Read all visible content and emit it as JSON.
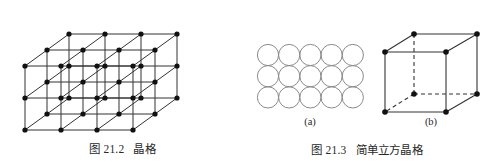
{
  "page": {
    "background": "#ffffff",
    "width": 489,
    "height": 168,
    "ink_color": "#333333",
    "node_color": "#111111",
    "sphere_stroke": "#8a8a8a"
  },
  "figures": [
    {
      "id": "lattice",
      "caption_number": "图 21.2",
      "caption_title": "晶格",
      "caption_full": "图 21.2　晶格",
      "diagram": {
        "type": "oblique-3d-point-lattice",
        "description": "three-dimensional crystal lattice drawn in oblique projection with filled nodes at every lattice point joined by straight edges",
        "grid_counts": {
          "columns": 4,
          "rows": 3,
          "layers": 3
        },
        "node_count": 36,
        "origin": {
          "x": 25,
          "y": 130
        },
        "vectors": {
          "a_right": {
            "dx": 36,
            "dy": 0
          },
          "b_depth": {
            "dx": 22,
            "dy": -16
          },
          "c_up": {
            "dx": 0,
            "dy": -32
          }
        },
        "node_radius": 2.6,
        "edge_width": 1.0
      }
    },
    {
      "id": "simple-cubic",
      "caption_number": "图 21.3",
      "caption_title": "简单立方晶格",
      "caption_full": "图 21.3　简单立方晶格",
      "panels": [
        {
          "label": "(a)",
          "diagram": {
            "type": "circle-packing-grid",
            "description": "simple cubic close packing shown as tangent circles in aligned rows and columns",
            "columns": 5,
            "rows": 3,
            "circle_count": 15,
            "circle_diameter": 21.2,
            "origin": {
              "x": 257.5,
              "y": 44.5
            },
            "stroke_width": 1.0
          }
        },
        {
          "label": "(b)",
          "diagram": {
            "type": "wireframe-cube",
            "description": "unit cell of a simple cubic lattice, atoms at the eight corners, hidden edges dashed",
            "vertex_count": 8,
            "visible_edge_count": 9,
            "hidden_edge_count": 3,
            "front_face": {
              "x": 385,
              "y": 52,
              "width": 61,
              "height": 60
            },
            "depth_offset": {
              "dx": 31,
              "dy": -18
            },
            "node_radius": 2.8,
            "edge_width": 1.1,
            "dash_pattern": "4,3"
          }
        }
      ]
    }
  ]
}
